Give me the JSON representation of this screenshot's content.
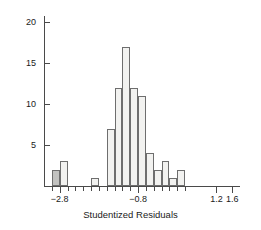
{
  "chart_data": {
    "type": "bar",
    "title": "",
    "subtitle": "",
    "xlabel": "Studentized Residuals",
    "ylabel": "Count",
    "xlim": [
      -3.2,
      1.8
    ],
    "ylim": [
      0,
      21
    ],
    "grid": false,
    "legend": null,
    "bin_width": 0.4,
    "x_tick_values": [
      -2.8,
      -0.8,
      1.2,
      1.6
    ],
    "x_tick_labels": [
      "−2.8",
      "−0.8",
      "1.2",
      "1.6"
    ],
    "y_tick_values": [
      5,
      10,
      15,
      20
    ],
    "y_tick_labels": [
      "5",
      "10",
      "15",
      "20"
    ],
    "bins": [
      {
        "left": -3.0,
        "right": -2.8,
        "value": 2,
        "highlight": true
      },
      {
        "left": -2.8,
        "right": -2.6,
        "value": 3,
        "highlight": false
      },
      {
        "left": -2.6,
        "right": -2.4,
        "value": 0,
        "highlight": false
      },
      {
        "left": -2.4,
        "right": -2.2,
        "value": 0,
        "highlight": false
      },
      {
        "left": -2.2,
        "right": -2.0,
        "value": 0,
        "highlight": false
      },
      {
        "left": -2.0,
        "right": -1.8,
        "value": 1,
        "highlight": false
      },
      {
        "left": -1.8,
        "right": -1.6,
        "value": 0,
        "highlight": false
      },
      {
        "left": -1.6,
        "right": -1.4,
        "value": 7,
        "highlight": false
      },
      {
        "left": -1.4,
        "right": -1.2,
        "value": 12,
        "highlight": false
      },
      {
        "left": -1.2,
        "right": -1.0,
        "value": 17,
        "highlight": false
      },
      {
        "left": -1.0,
        "right": -0.8,
        "value": 12,
        "highlight": false
      },
      {
        "left": -0.8,
        "right": -0.6,
        "value": 11,
        "highlight": false
      },
      {
        "left": -0.6,
        "right": -0.4,
        "value": 4,
        "highlight": false
      },
      {
        "left": -0.4,
        "right": -0.2,
        "value": 2,
        "highlight": false
      },
      {
        "left": -0.2,
        "right": 0.0,
        "value": 3,
        "highlight": false
      },
      {
        "left": 0.0,
        "right": 0.2,
        "value": 1,
        "highlight": false
      },
      {
        "left": 0.2,
        "right": 0.4,
        "value": 2,
        "highlight": false
      }
    ],
    "colors": {
      "bar_fill": "#f2f2f0",
      "bar_highlight_fill": "#c2c2c0",
      "bar_stroke": "#6e6e6e",
      "axis": "#4a4a4a",
      "text": "#1a1a1a",
      "background": "#ffffff"
    }
  }
}
